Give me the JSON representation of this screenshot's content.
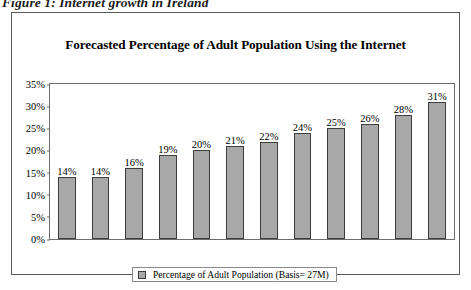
{
  "figure": {
    "caption": "Figure 1: Internet growth in Ireland"
  },
  "chart_data": {
    "type": "bar",
    "title": "Forecasted Percentage of Adult Population Using the Internet",
    "xlabel": "",
    "ylabel": "",
    "categories": [
      "",
      "",
      "",
      "",
      "",
      "",
      "",
      "",
      "",
      "",
      "",
      ""
    ],
    "values": [
      14,
      14,
      16,
      19,
      20,
      21,
      22,
      24,
      25,
      26,
      28,
      31
    ],
    "data_labels": [
      "14%",
      "14%",
      "16%",
      "19%",
      "20%",
      "21%",
      "22%",
      "24%",
      "25%",
      "26%",
      "28%",
      "31%"
    ],
    "ylim": [
      0,
      35
    ],
    "ytick_values": [
      0,
      5,
      10,
      15,
      20,
      25,
      30,
      35
    ],
    "ytick_labels": [
      "0%",
      "5%",
      "10%",
      "15%",
      "20%",
      "25%",
      "30%",
      "35%"
    ],
    "grid": false,
    "legend_position": "bottom",
    "legend": [
      {
        "name": "Percentage of Adult Population (Basis= 27M)",
        "color": "#a8a8a8"
      }
    ],
    "series": [
      {
        "name": "Percentage of Adult Population (Basis= 27M)",
        "color": "#a8a8a8",
        "values": [
          14,
          14,
          16,
          19,
          20,
          21,
          22,
          24,
          25,
          26,
          28,
          31
        ]
      }
    ]
  },
  "colors": {
    "bar_fill": "#a8a8a8",
    "bar_border": "#3d3d3d",
    "frame": "#5a5a5a",
    "axis": "#6d6d6d",
    "text": "#000000",
    "background": "#ffffff"
  }
}
